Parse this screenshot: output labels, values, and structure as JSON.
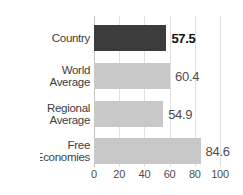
{
  "chart_data": {
    "type": "bar",
    "orientation": "horizontal",
    "title": "",
    "xlabel": "",
    "ylabel": "",
    "categories": [
      [
        "Country"
      ],
      [
        "World",
        "Average"
      ],
      [
        "Regional",
        "Average"
      ],
      [
        "Free",
        "Economies"
      ]
    ],
    "values": [
      57.5,
      60.4,
      54.9,
      84.6
    ],
    "value_labels": [
      "57.5",
      "60.4",
      "54.9",
      "84.6"
    ],
    "highlight_index": 0,
    "xlim": [
      0,
      100
    ],
    "xticks": [
      0,
      20,
      40,
      60,
      80,
      100
    ],
    "xtick_labels": [
      "0",
      "20",
      "40",
      "60",
      "80",
      "100"
    ],
    "grid": "vertical",
    "legend": "none",
    "colors": {
      "highlight_bar": "#3c3c3c",
      "bar": "#c8c8c8",
      "gridline": "#e1e1e1",
      "zero_line": "#c4c4c4",
      "label_text": "#3d3d3d",
      "value_text": "#4d4d4d",
      "highlight_value_text": "#141414",
      "tick_text": "#4d4d4d",
      "background": "#ffffff"
    }
  }
}
